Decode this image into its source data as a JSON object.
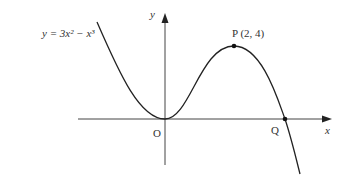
{
  "diagram": {
    "curve_label": "y = 3x² − x³",
    "y_axis_label": "y",
    "x_axis_label": "x",
    "origin_label": "O",
    "point_p_label": "P (2, 4)",
    "point_q_label": "Q"
  }
}
